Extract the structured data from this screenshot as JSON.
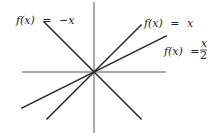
{
  "chart_data": {
    "type": "line",
    "title": "",
    "xlabel": "",
    "ylabel": "",
    "xlim": [
      -5,
      5
    ],
    "ylim": [
      -4.5,
      4.5
    ],
    "grid": false,
    "axes_color": "#444444",
    "line_color": "#222222",
    "series": [
      {
        "name": "f(x) = -x",
        "slope": -1,
        "x": [
          -3.6,
          3.4
        ],
        "label": {
          "lhs": "f(x)",
          "eq": "=",
          "rhs": "−x"
        },
        "label_position": "top-left"
      },
      {
        "name": "f(x) = x",
        "slope": 1,
        "x": [
          -3.4,
          3.4
        ],
        "label": {
          "lhs": "f(x)",
          "eq": "=",
          "rhs": "x"
        },
        "label_position": "top-right"
      },
      {
        "name": "f(x) = x/2",
        "slope": 0.5,
        "x": [
          -5.2,
          5.2
        ],
        "label": {
          "lhs": "f(x)",
          "eq": "=",
          "num": "x",
          "den": "2"
        },
        "label_position": "right"
      }
    ]
  }
}
